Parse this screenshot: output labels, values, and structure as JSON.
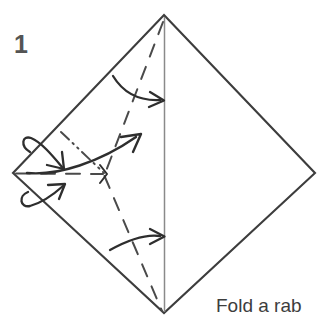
{
  "diagram": {
    "step_number": "1",
    "caption_text": "Fold a rab",
    "colors": {
      "paper_outline": "#3d3d3d",
      "fold_line": "#4a4a4a",
      "arrow": "#2e2e2e",
      "step_number": "#545454",
      "caption": "#3d3d3d",
      "background": "#ffffff"
    },
    "shape": {
      "name": "square-rotated-diamond",
      "vertices": {
        "top": [
          164,
          15
        ],
        "right": [
          315,
          173
        ],
        "bottom": [
          164,
          313
        ],
        "left": [
          13,
          173
        ]
      }
    },
    "lines": [
      {
        "name": "center-vertical-crease",
        "style": "solid-thin",
        "from": [
          164,
          15
        ],
        "to": [
          164,
          313
        ]
      },
      {
        "name": "upper-valley-fold",
        "style": "dashed",
        "from": [
          163,
          20
        ],
        "to": [
          104,
          176
        ]
      },
      {
        "name": "lower-valley-fold",
        "style": "dashed",
        "from": [
          104,
          176
        ],
        "to": [
          162,
          310
        ]
      },
      {
        "name": "horizontal-valley-fold",
        "style": "dashed",
        "from": [
          15,
          173
        ],
        "to": [
          104,
          174
        ]
      },
      {
        "name": "mountain-fold",
        "style": "dash-dot-dot",
        "from": [
          62,
          133
        ],
        "to": [
          104,
          174
        ]
      }
    ],
    "arrows": [
      {
        "name": "upper-fold-arrow",
        "kind": "curved",
        "direction": "right",
        "from": [
          113,
          75
        ],
        "to": [
          164,
          100
        ]
      },
      {
        "name": "middle-fold-arrow",
        "kind": "curved-long",
        "direction": "up-right",
        "from": [
          28,
          172
        ],
        "to": [
          140,
          136
        ]
      },
      {
        "name": "lower-fold-arrow",
        "kind": "curved",
        "direction": "right",
        "from": [
          110,
          248
        ],
        "to": [
          164,
          237
        ]
      },
      {
        "name": "upper-loop-fold-unfold-arrow",
        "kind": "loop",
        "direction": "down-right",
        "from": [
          22,
          142
        ],
        "to": [
          63,
          166
        ]
      },
      {
        "name": "lower-loop-fold-unfold-arrow",
        "kind": "loop",
        "direction": "up-right",
        "from": [
          22,
          204
        ],
        "to": [
          62,
          184
        ]
      }
    ]
  }
}
